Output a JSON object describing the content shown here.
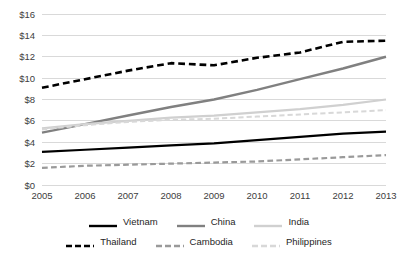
{
  "chart_data": {
    "type": "line",
    "title": "",
    "subtitle": "",
    "xlabel": "",
    "ylabel": "",
    "categories": [
      "2005",
      "2006",
      "2007",
      "2008",
      "2009",
      "2010",
      "2011",
      "2012",
      "2013"
    ],
    "x_tick_labels": [
      "2005",
      "2006",
      "2007",
      "2008",
      "2009",
      "2010",
      "2011",
      "2012",
      "2013"
    ],
    "y_tick_labels": [
      "$0",
      "$2",
      "$4",
      "$6",
      "$8",
      "$10",
      "$12",
      "$14",
      "$16"
    ],
    "y_tick_values": [
      0,
      2,
      4,
      6,
      8,
      10,
      12,
      14,
      16
    ],
    "ylim": [
      0,
      16
    ],
    "grid": "horizontal",
    "legend_position": "bottom",
    "series": [
      {
        "name": "Vietnam",
        "color": "#000000",
        "style": "solid",
        "width": 2.2,
        "values": [
          3.1,
          3.3,
          3.5,
          3.7,
          3.9,
          4.2,
          4.5,
          4.8,
          5.0
        ]
      },
      {
        "name": "China",
        "color": "#808080",
        "style": "solid",
        "width": 2.4,
        "values": [
          4.9,
          5.7,
          6.5,
          7.3,
          8.0,
          8.9,
          9.9,
          10.9,
          12.0
        ]
      },
      {
        "name": "India",
        "color": "#d0d0d0",
        "style": "solid",
        "width": 2.2,
        "values": [
          5.3,
          5.7,
          6.0,
          6.3,
          6.5,
          6.8,
          7.1,
          7.5,
          8.0
        ]
      },
      {
        "name": "Thailand",
        "color": "#000000",
        "style": "dashed",
        "width": 2.6,
        "values": [
          9.1,
          9.9,
          10.7,
          11.4,
          11.2,
          11.9,
          12.4,
          13.4,
          13.5
        ]
      },
      {
        "name": "Cambodia",
        "color": "#9a9a9a",
        "style": "dashed",
        "width": 2.2,
        "values": [
          1.6,
          1.8,
          1.9,
          2.0,
          2.1,
          2.2,
          2.4,
          2.6,
          2.8
        ]
      },
      {
        "name": "Philippines",
        "color": "#d8d8d8",
        "style": "dashed",
        "width": 2.0,
        "values": [
          5.2,
          5.6,
          5.9,
          6.1,
          6.2,
          6.4,
          6.6,
          6.8,
          7.0
        ]
      }
    ]
  },
  "legend": {
    "rows": [
      [
        {
          "label": "Vietnam",
          "color": "#000000",
          "style": "solid"
        },
        {
          "label": "China",
          "color": "#808080",
          "style": "solid"
        },
        {
          "label": "India",
          "color": "#d0d0d0",
          "style": "solid"
        }
      ],
      [
        {
          "label": "Thailand",
          "color": "#000000",
          "style": "dashed"
        },
        {
          "label": "Cambodia",
          "color": "#9a9a9a",
          "style": "dashed"
        },
        {
          "label": "Philippines",
          "color": "#d8d8d8",
          "style": "dashed"
        }
      ]
    ]
  },
  "style": {
    "grid_color": "#d9d9d9",
    "text_color": "#404040",
    "background": "#ffffff"
  }
}
